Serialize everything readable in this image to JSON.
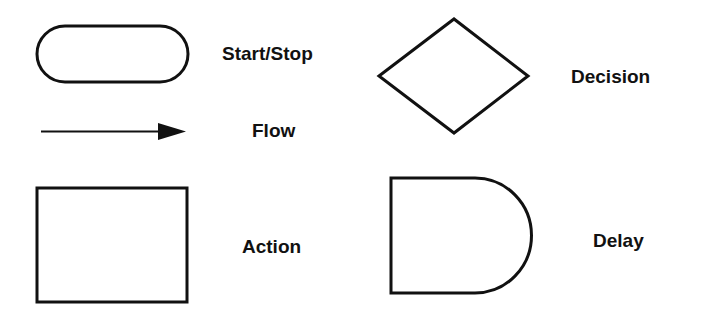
{
  "legend": {
    "stroke_color": "#111111",
    "items": [
      {
        "shape": "stadium",
        "label": "Start/Stop"
      },
      {
        "shape": "arrow",
        "label": "Flow"
      },
      {
        "shape": "rectangle",
        "label": "Action"
      },
      {
        "shape": "diamond",
        "label": "Decision"
      },
      {
        "shape": "d-shape",
        "label": "Delay"
      }
    ]
  }
}
